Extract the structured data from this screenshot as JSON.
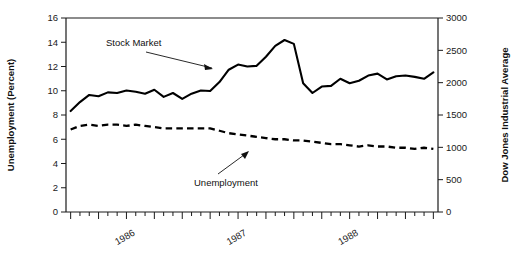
{
  "chart_data": {
    "type": "line",
    "title": "",
    "xlabel": "",
    "ylabel": "Unemployment (Percent)",
    "y2label": "Dow Jones Industrial Average",
    "ylim": [
      0,
      16
    ],
    "y2lim": [
      0,
      3000
    ],
    "ytick_labels": [
      "0",
      "2",
      "4",
      "6",
      "8",
      "10",
      "12",
      "14",
      "16"
    ],
    "ytick_values": [
      0,
      2,
      4,
      6,
      8,
      10,
      12,
      14,
      16
    ],
    "y2tick_labels": [
      "0",
      "500",
      "1000",
      "1500",
      "2000",
      "2500",
      "3000"
    ],
    "y2tick_values": [
      0,
      500,
      1000,
      1500,
      2000,
      2500,
      3000
    ],
    "xtick_labels": [
      "1986",
      "1987",
      "1988"
    ],
    "xtick_positions": [
      6,
      18,
      30
    ],
    "x_minor_ticks": "monthly",
    "grid": false,
    "legend_position": "inline-annotations",
    "annotations": [
      {
        "text": "Stock Market",
        "points_to_series": "Stock Market"
      },
      {
        "text": "Unemployment",
        "points_to_series": "Unemployment"
      }
    ],
    "x": [
      "1985-09",
      "1985-10",
      "1985-11",
      "1985-12",
      "1986-01",
      "1986-02",
      "1986-03",
      "1986-04",
      "1986-05",
      "1986-06",
      "1986-07",
      "1986-08",
      "1986-09",
      "1986-10",
      "1986-11",
      "1986-12",
      "1987-01",
      "1987-02",
      "1987-03",
      "1987-04",
      "1987-05",
      "1987-06",
      "1987-07",
      "1987-08",
      "1987-09",
      "1987-10",
      "1987-11",
      "1987-12",
      "1988-01",
      "1988-02",
      "1988-03",
      "1988-04",
      "1988-05",
      "1988-06",
      "1988-07",
      "1988-08",
      "1988-09",
      "1988-10",
      "1988-11",
      "1988-12"
    ],
    "series": [
      {
        "name": "Stock Market",
        "axis": "right",
        "unit": "Dow Jones Industrial Average",
        "style": "solid",
        "values": [
          1560,
          1700,
          1810,
          1790,
          1850,
          1840,
          1880,
          1860,
          1830,
          1890,
          1780,
          1840,
          1750,
          1830,
          1880,
          1870,
          2010,
          2200,
          2280,
          2250,
          2260,
          2400,
          2570,
          2660,
          2600,
          1990,
          1840,
          1940,
          1950,
          2060,
          1990,
          2030,
          2110,
          2140,
          2050,
          2100,
          2110,
          2090,
          2060,
          2160
        ]
      },
      {
        "name": "Unemployment",
        "axis": "left",
        "unit": "Percent",
        "style": "dashed",
        "values": [
          6.8,
          7.1,
          7.2,
          7.1,
          7.2,
          7.2,
          7.1,
          7.2,
          7.1,
          7.0,
          6.9,
          6.9,
          6.9,
          6.9,
          6.9,
          6.9,
          6.7,
          6.5,
          6.4,
          6.3,
          6.2,
          6.1,
          6.0,
          6.0,
          5.9,
          5.9,
          5.8,
          5.7,
          5.6,
          5.6,
          5.5,
          5.4,
          5.5,
          5.4,
          5.4,
          5.3,
          5.3,
          5.2,
          5.3,
          5.2
        ]
      }
    ]
  },
  "labels": {
    "left_axis_title": "Unemployment (Percent)",
    "right_axis_title": "Dow Jones Industrial Average",
    "annotation_stock": "Stock Market",
    "annotation_unemployment": "Unemployment"
  }
}
